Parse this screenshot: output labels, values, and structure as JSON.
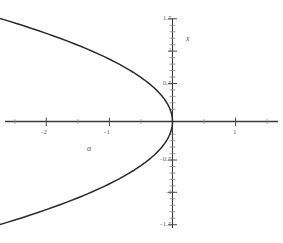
{
  "chart_data": {
    "type": "line",
    "title": "",
    "subtitle": "",
    "xlabel": "α",
    "ylabel": "x",
    "xlim": [
      -2.55,
      1.45
    ],
    "ylim": [
      -1.62,
      1.62
    ],
    "grid": false,
    "legend": null,
    "annotations": [],
    "axis_style": "crossed-at-origin",
    "xticks": [
      -2,
      -1,
      1
    ],
    "xtick_labels": [
      "-2",
      "-1",
      "1"
    ],
    "yticks": [
      1.5,
      1,
      0.5,
      -0.5,
      -1,
      -1.5
    ],
    "ytick_labels": [
      "1.5",
      "1",
      "0.5",
      "-0.5",
      "-1",
      "-1.5"
    ],
    "minor_tick_step": 0.1,
    "series": [
      {
        "name": "alpha = -x^2",
        "relation": "α = -x²",
        "color": "#2b2b2b",
        "x": [
          -2.5408,
          -2.4336,
          -2.3104,
          -2.1904,
          -2.0736,
          -1.96,
          -1.8496,
          -1.7424,
          -1.6384,
          -1.5376,
          -1.44,
          -1.3456,
          -1.2544,
          -1.1664,
          -1.0816,
          -1.0,
          -0.9216,
          -0.8464,
          -0.7744,
          -0.7056,
          -0.64,
          -0.5776,
          -0.5184,
          -0.4624,
          -0.4096,
          -0.36,
          -0.3136,
          -0.2704,
          -0.2304,
          -0.1936,
          -0.16,
          -0.1296,
          -0.1024,
          -0.0784,
          -0.0576,
          -0.04,
          -0.0256,
          -0.0144,
          -0.0064,
          -0.0016,
          0.0,
          -0.0016,
          -0.0064,
          -0.0144,
          -0.0256,
          -0.04,
          -0.0576,
          -0.0784,
          -0.1024,
          -0.1296,
          -0.16,
          -0.1936,
          -0.2304,
          -0.2704,
          -0.3136,
          -0.36,
          -0.4096,
          -0.4624,
          -0.5184,
          -0.5776,
          -0.64,
          -0.7056,
          -0.7744,
          -0.8464,
          -0.9216,
          -1.0,
          -1.0816,
          -1.1664,
          -1.2544,
          -1.3456,
          -1.44,
          -1.5376,
          -1.6384,
          -1.7424,
          -1.8496,
          -1.96,
          -2.0736,
          -2.1904,
          -2.3104,
          -2.4336,
          -2.5408
        ],
        "y": [
          1.594,
          1.56,
          1.52,
          1.48,
          1.44,
          1.4,
          1.36,
          1.32,
          1.28,
          1.24,
          1.2,
          1.16,
          1.12,
          1.08,
          1.04,
          1.0,
          0.96,
          0.92,
          0.88,
          0.84,
          0.8,
          0.76,
          0.72,
          0.68,
          0.64,
          0.6,
          0.56,
          0.52,
          0.48,
          0.44,
          0.4,
          0.36,
          0.32,
          0.28,
          0.24,
          0.2,
          0.16,
          0.12,
          0.08,
          0.04,
          0.0,
          -0.04,
          -0.08,
          -0.12,
          -0.16,
          -0.2,
          -0.24,
          -0.28,
          -0.32,
          -0.36,
          -0.4,
          -0.44,
          -0.48,
          -0.52,
          -0.56,
          -0.6,
          -0.64,
          -0.68,
          -0.72,
          -0.76,
          -0.8,
          -0.84,
          -0.88,
          -0.92,
          -0.96,
          -1.0,
          -1.04,
          -1.08,
          -1.12,
          -1.16,
          -1.2,
          -1.24,
          -1.28,
          -1.32,
          -1.36,
          -1.4,
          -1.44,
          -1.48,
          -1.52,
          -1.56,
          -1.594
        ]
      }
    ]
  },
  "labels": {
    "x_axis_name": "α",
    "y_axis_name": "x",
    "xtick_neg2": "-2",
    "xtick_neg1": "-1",
    "xtick_pos1": "1",
    "ytick_1p5": "1.5",
    "ytick_1": "1",
    "ytick_0p5": "0.5",
    "ytick_neg0p5": "-0.5",
    "ytick_neg1": "-1",
    "ytick_neg1p5": "-1.5"
  },
  "colors": {
    "curve": "#2b2b2b",
    "axis": "#3a3a3a",
    "tick_text": "#6e6e6e",
    "axis_label_text": "#5c5c5c",
    "background": "#ffffff"
  }
}
